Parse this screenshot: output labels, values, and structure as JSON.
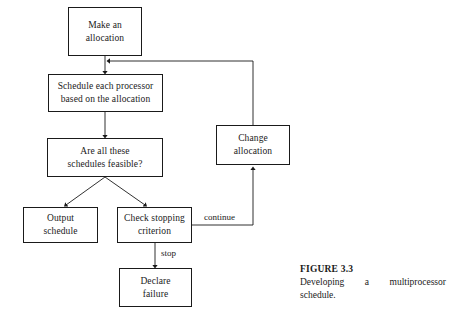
{
  "figure": {
    "caption_title": "FIGURE 3.3",
    "caption_text": "Developing a multiprocessor schedule."
  },
  "diagram": {
    "type": "flowchart",
    "nodes": [
      {
        "id": "make-allocation",
        "label": "Make an\nallocation",
        "x": 68,
        "y": 7,
        "w": 74,
        "h": 49
      },
      {
        "id": "schedule-each",
        "label": "Schedule each processor\nbased on the allocation",
        "x": 48,
        "y": 74,
        "w": 115,
        "h": 38
      },
      {
        "id": "are-feasible",
        "label": "Are all these\nschedules feasible?",
        "x": 47,
        "y": 138,
        "w": 116,
        "h": 39
      },
      {
        "id": "output-schedule",
        "label": "Output\nschedule",
        "x": 23,
        "y": 207,
        "w": 75,
        "h": 36
      },
      {
        "id": "check-stopping",
        "label": "Check stopping\ncriterion",
        "x": 117,
        "y": 207,
        "w": 75,
        "h": 36
      },
      {
        "id": "declare-failure",
        "label": "Declare\nfailure",
        "x": 119,
        "y": 268,
        "w": 73,
        "h": 39
      },
      {
        "id": "change-allocation",
        "label": "Change\nallocation",
        "x": 216,
        "y": 125,
        "w": 74,
        "h": 40
      }
    ],
    "edge_labels": [
      {
        "id": "continue",
        "text": "continue",
        "x": 203,
        "y": 213
      },
      {
        "id": "stop",
        "text": "stop",
        "x": 160,
        "y": 249
      }
    ]
  }
}
